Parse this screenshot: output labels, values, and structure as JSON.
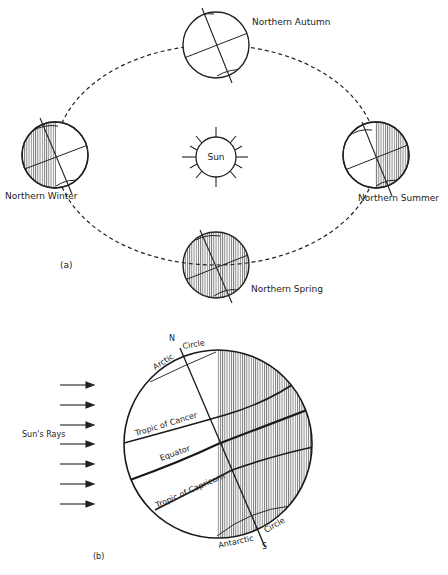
{
  "figure_a": {
    "panel_label": "(a)",
    "sun_label": "Sun",
    "positions": [
      {
        "id": "autumn",
        "label": "Northern Autumn"
      },
      {
        "id": "winter",
        "label": "Northern Winter"
      },
      {
        "id": "summer",
        "label": "Northern Summer"
      },
      {
        "id": "spring",
        "label": "Northern Spring"
      }
    ]
  },
  "figure_b": {
    "panel_label": "(b)",
    "rays_label": "Sun's Rays",
    "ray_count": 7,
    "north_label": "N",
    "south_label": "S",
    "arctic_left": "Arctic",
    "arctic_right": "Circle",
    "tropic_cancer": "Tropic of Cancer",
    "equator": "Equator",
    "tropic_capricorn": "Tropic of Capricorn",
    "antarctic_left": "Antarctic",
    "antarctic_right": "Circle"
  },
  "colors": {
    "ink": "#1a1a1a",
    "background": "#ffffff"
  }
}
